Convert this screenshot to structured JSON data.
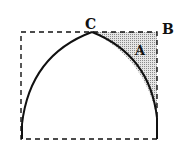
{
  "diagram": {
    "type": "pointed-arch-in-rectangle",
    "labels": {
      "apex": "C",
      "corner": "B",
      "region": "A"
    },
    "colors": {
      "stroke": "#111111",
      "shade": "#c8c8c8",
      "background": "#ffffff"
    }
  }
}
